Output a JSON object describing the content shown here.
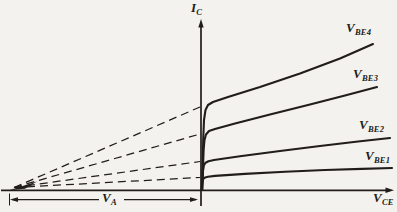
{
  "figure": {
    "description_labels": {
      "ic": {
        "base": "I",
        "sub": "C"
      },
      "vce": {
        "base": "V",
        "sub": "CE"
      },
      "va": {
        "base": "V",
        "sub": "A"
      },
      "vbe4": {
        "base": "V",
        "sub": "BE4"
      },
      "vbe3": {
        "base": "V",
        "sub": "BE3"
      },
      "vbe2": {
        "base": "V",
        "sub": "BE2"
      },
      "vbe1": {
        "base": "V",
        "sub": "BE1"
      }
    }
  },
  "chart_data": {
    "type": "line",
    "xlabel": "V_CE",
    "ylabel": "I_C",
    "x_ticks": [],
    "y_ticks": [],
    "annotation": "V_A (Early voltage span marked from dashed-line convergence point to the I_C axis)",
    "grid": false,
    "legend": "none (curves labeled directly: V_BE4, V_BE3, V_BE2, V_BE1 top to bottom)",
    "style": {
      "ink": "#201d1a",
      "background": "#f4f2ee",
      "dash_pattern": "8 5",
      "curve_width": 2.1,
      "axis_width": 1.7,
      "dash_width": 1.25,
      "dim_width": 1.1
    },
    "x_axis_px": {
      "from": [
        1,
        190.3
      ],
      "to": [
        386,
        190.3
      ],
      "tip": [
        394,
        190.3
      ]
    },
    "y_axis_px": {
      "from": [
        201,
        206
      ],
      "to": [
        201,
        28
      ],
      "tip": [
        201,
        19
      ]
    },
    "convergence_point_px": [
      14,
      187.5
    ],
    "convergence_wedge_px": [
      [
        9,
        190.2
      ],
      [
        37,
        181.6
      ],
      [
        25,
        188.8
      ]
    ],
    "va_dimension": {
      "y": 199.6,
      "x1": 10,
      "x2": 198,
      "gap": [
        99,
        124
      ],
      "tick_x": 9.5,
      "tick_y": [
        193.5,
        205.5
      ]
    },
    "series": [
      {
        "name": "V_BE4",
        "points_px": [
          [
            202,
            190
          ],
          [
            202.8,
            165
          ],
          [
            203.2,
            140
          ],
          [
            204,
            120
          ],
          [
            205.5,
            110
          ],
          [
            208,
            105
          ],
          [
            213,
            102
          ],
          [
            228,
            97
          ],
          [
            260,
            87
          ],
          [
            300,
            73.5
          ],
          [
            340,
            58.5
          ],
          [
            373,
            44
          ]
        ],
        "dashed_px": [
          [
            14,
            187.5
          ],
          [
            200,
            107
          ]
        ]
      },
      {
        "name": "V_BE3",
        "points_px": [
          [
            202.3,
            190
          ],
          [
            203,
            168
          ],
          [
            203.6,
            150
          ],
          [
            204.5,
            140
          ],
          [
            206,
            134.5
          ],
          [
            209,
            131
          ],
          [
            215,
            129
          ],
          [
            235,
            123.5
          ],
          [
            270,
            114.5
          ],
          [
            310,
            104.5
          ],
          [
            345,
            95.5
          ],
          [
            377,
            87
          ]
        ],
        "dashed_px": [
          [
            14,
            187.5
          ],
          [
            200,
            134
          ]
        ]
      },
      {
        "name": "V_BE2",
        "points_px": [
          [
            202,
            190
          ],
          [
            202.4,
            180
          ],
          [
            203,
            171
          ],
          [
            203.8,
            165.5
          ],
          [
            205.5,
            162.8
          ],
          [
            208.5,
            161.2
          ],
          [
            214,
            160
          ],
          [
            240,
            156.3
          ],
          [
            280,
            151
          ],
          [
            320,
            146
          ],
          [
            358,
            141.5
          ],
          [
            390,
            138
          ]
        ],
        "dashed_px": [
          [
            14,
            187.5
          ],
          [
            200,
            161.5
          ]
        ]
      },
      {
        "name": "V_BE1",
        "points_px": [
          [
            201.6,
            190
          ],
          [
            202,
            185
          ],
          [
            202.4,
            181.5
          ],
          [
            203.2,
            179
          ],
          [
            205,
            177.6
          ],
          [
            208,
            176.8
          ],
          [
            215,
            175.9
          ],
          [
            245,
            173.9
          ],
          [
            285,
            171.8
          ],
          [
            325,
            170
          ],
          [
            362,
            168.9
          ],
          [
            392,
            168
          ]
        ],
        "dashed_px": [
          [
            14,
            187.5
          ],
          [
            200,
            177.5
          ]
        ]
      }
    ]
  }
}
